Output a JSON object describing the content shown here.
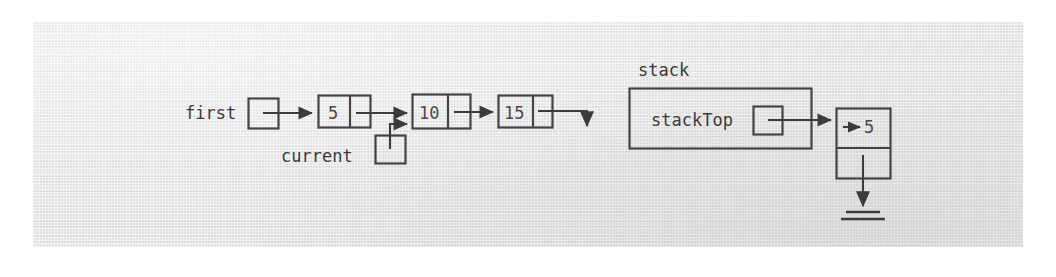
{
  "figure": {
    "kind": "linked-list-and-stack-diagram",
    "background_color": "#e2e2e2",
    "ink_color": "#3b3b3b",
    "page_color": "#ffffff"
  },
  "linked_list": {
    "head_pointer": {
      "label": "first"
    },
    "current_pointer": {
      "label": "current",
      "points_to_node_index": 1
    },
    "nodes": [
      {
        "value": "5"
      },
      {
        "value": "10"
      },
      {
        "value": "15"
      }
    ],
    "tail_terminator": "null-arrow-down"
  },
  "stack": {
    "label": "stack",
    "top_pointer": {
      "label": "stackTop"
    },
    "node": {
      "value": "5",
      "next_terminator": "ground-null"
    }
  }
}
